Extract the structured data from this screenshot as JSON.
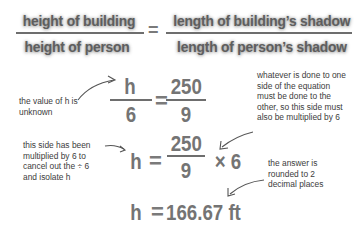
{
  "proportion": {
    "left_numerator": "height of building",
    "left_denominator": "height of person",
    "equals": "=",
    "right_numerator": "length of building’s shadow",
    "right_denominator": "length of person’s shadow"
  },
  "step1": {
    "lhs_numerator": "h",
    "lhs_denominator": "6",
    "equals": "=",
    "rhs_numerator": "250",
    "rhs_denominator": "9"
  },
  "step2": {
    "lhs": "h",
    "equals": "=",
    "rhs_numerator": "250",
    "rhs_denominator": "9",
    "multiplier": "× 6"
  },
  "result": {
    "lhs": "h",
    "equals": "=",
    "value": "166.67 ft"
  },
  "annotations": {
    "unknown": [
      "the value of h is",
      "unknown"
    ],
    "whatever": [
      "whatever is done to one",
      "side of the equation",
      "must be done to the",
      "other, so this side must",
      "also be multiplied by 6"
    ],
    "multiplied": [
      "this side has been",
      "multiplied by 6 to",
      "cancel out the ÷ 6",
      "and isolate h"
    ],
    "rounded": [
      "the answer is",
      "rounded to 2",
      "decimal places"
    ]
  }
}
